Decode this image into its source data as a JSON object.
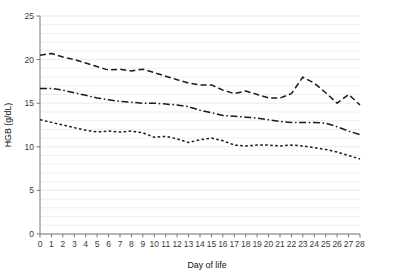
{
  "chart_data": {
    "type": "line",
    "title": "",
    "subtitle": "",
    "xlabel": "Day of life",
    "ylabel": "HGB (g/dL)",
    "xlim": [
      0,
      28
    ],
    "ylim": [
      0,
      25
    ],
    "xticks": [
      0,
      1,
      2,
      3,
      4,
      5,
      6,
      7,
      8,
      9,
      10,
      11,
      12,
      13,
      14,
      15,
      16,
      17,
      18,
      19,
      20,
      21,
      22,
      23,
      24,
      25,
      26,
      27,
      28
    ],
    "xtick_labels": [
      "0",
      "1",
      "2",
      "3",
      "4",
      "5",
      "6",
      "7",
      "8",
      "9",
      "10",
      "11",
      "12",
      "13",
      "14",
      "15",
      "16",
      "17",
      "18",
      "19",
      "20",
      "21",
      "22",
      "23",
      "24",
      "25",
      "26",
      "27",
      "28"
    ],
    "yticks": [
      0,
      5,
      10,
      15,
      20,
      25
    ],
    "ytick_labels": [
      "0",
      "5",
      "10",
      "15",
      "20",
      "25"
    ],
    "grid": "horizontal-minor",
    "grid_color": "#e8e8ee",
    "legend": "none",
    "line_color": "#1a1a1a",
    "x": [
      0,
      1,
      2,
      3,
      4,
      5,
      6,
      7,
      8,
      9,
      10,
      11,
      12,
      13,
      14,
      15,
      16,
      17,
      18,
      19,
      20,
      21,
      22,
      23,
      24,
      25,
      26,
      27,
      28
    ],
    "series": [
      {
        "name": "Upper percentile",
        "dash": "dashed",
        "color": "#1a1a1a",
        "values": [
          20.5,
          20.7,
          20.3,
          20.0,
          19.6,
          19.2,
          18.8,
          18.9,
          18.7,
          18.9,
          18.5,
          18.1,
          17.7,
          17.3,
          17.1,
          17.1,
          16.5,
          16.1,
          16.4,
          16.0,
          15.6,
          15.6,
          16.1,
          18.0,
          17.3,
          16.2,
          15.0,
          16.0,
          14.8
        ]
      },
      {
        "name": "Median percentile",
        "dash": "dash-dot",
        "color": "#1a1a1a",
        "values": [
          16.7,
          16.7,
          16.5,
          16.2,
          15.9,
          15.6,
          15.4,
          15.2,
          15.1,
          15.0,
          15.0,
          14.9,
          14.8,
          14.6,
          14.2,
          13.9,
          13.6,
          13.5,
          13.4,
          13.3,
          13.1,
          12.9,
          12.8,
          12.8,
          12.8,
          12.7,
          12.3,
          11.8,
          11.4
        ]
      },
      {
        "name": "Lower percentile",
        "dash": "dotted",
        "color": "#1a1a1a",
        "values": [
          13.1,
          12.8,
          12.5,
          12.2,
          11.9,
          11.7,
          11.8,
          11.7,
          11.8,
          11.6,
          11.1,
          11.2,
          10.9,
          10.5,
          10.8,
          11.0,
          10.7,
          10.2,
          10.1,
          10.2,
          10.2,
          10.1,
          10.2,
          10.1,
          9.9,
          9.7,
          9.4,
          9.0,
          8.6
        ]
      }
    ]
  }
}
